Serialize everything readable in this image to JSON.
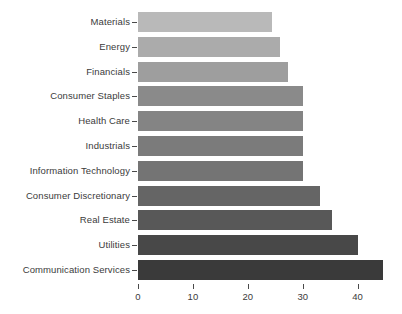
{
  "chart_data": {
    "type": "bar",
    "orientation": "horizontal",
    "title": "",
    "subtitle": "",
    "xlabel": "",
    "ylabel": "",
    "categories": [
      "Materials",
      "Energy",
      "Financials",
      "Consumer Staples",
      "Health Care",
      "Industrials",
      "Information Technology",
      "Consumer Discretionary",
      "Real Estate",
      "Utilities",
      "Communication Services"
    ],
    "values": [
      24.5,
      25.9,
      27.4,
      30.0,
      30.0,
      30.0,
      30.0,
      33.2,
      35.4,
      40.0,
      44.6
    ],
    "bar_colors": [
      "#b9b9b9",
      "#ababab",
      "#9e9e9e",
      "#8a8a8a",
      "#848484",
      "#7b7b7b",
      "#747474",
      "#656565",
      "#585858",
      "#484848",
      "#3a3a3a"
    ],
    "xlim": [
      0,
      47
    ],
    "x_ticks": [
      0,
      10,
      20,
      30,
      40
    ],
    "x_tick_labels": [
      "0",
      "10",
      "20",
      "30",
      "40"
    ],
    "grid": false,
    "legend": false,
    "legend_position": "none",
    "axis_color": "#4a4a4a",
    "text_color": "#3b3b3b",
    "background": "#ffffff"
  }
}
